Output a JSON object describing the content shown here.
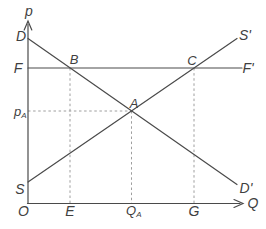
{
  "figure": {
    "colors": {
      "line": "#4a4a4a",
      "dashed": "#9e9e9e",
      "text": "#3f3f3f",
      "background": "#ffffff"
    },
    "labels": {
      "p_axis": "p",
      "q_axis": "Q",
      "origin": "O",
      "demand_top": "D",
      "demand_bottom": "D'",
      "supply_bottom": "S",
      "supply_top": "S'",
      "floor_left": "F",
      "floor_right": "F'",
      "point_a": "A",
      "point_b": "B",
      "point_c": "C",
      "tick_e": "E",
      "tick_g": "G",
      "price_a": {
        "main": "p",
        "sub": "A"
      },
      "quantity_a": {
        "main": "Q",
        "sub": "A"
      }
    }
  }
}
